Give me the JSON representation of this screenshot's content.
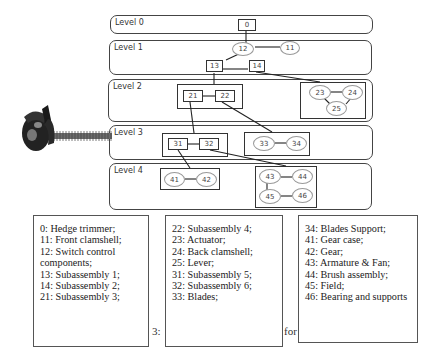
{
  "diagram": {
    "levels": [
      {
        "label": "Level 0"
      },
      {
        "label": "Level 1"
      },
      {
        "label": "Level 2"
      },
      {
        "label": "Level 3"
      },
      {
        "label": "Level 4"
      }
    ],
    "nodes": {
      "n0": "0",
      "n11": "11",
      "n12": "12",
      "n13": "13",
      "n14": "14",
      "n21": "21",
      "n22": "22",
      "n23": "23",
      "n24": "24",
      "n25": "25",
      "n31": "31",
      "n32": "32",
      "n33": "33",
      "n34": "34",
      "n41": "41",
      "n42": "42",
      "n43": "43",
      "n44": "44",
      "n45": "45",
      "n46": "46"
    },
    "image": "hedge-trimmer-photo"
  },
  "legend": {
    "col1": [
      "0: Hedge trimmer;",
      "11: Front clamshell;",
      "12: Switch control",
      "components;",
      "13: Subassembly 1;",
      "14: Subassembly 2;",
      "21: Subassembly 3;"
    ],
    "col2": [
      "22: Subassembly 4;",
      "23: Actuator;",
      "24: Back clamshell;",
      "25: Lever;",
      "31: Subassembly 5;",
      "32: Subassembly 6;",
      "33: Blades;"
    ],
    "col3": [
      "34: Blades Support;",
      "41: Gear case;",
      "42: Gear;",
      "43: Armature & Fan;",
      "44: Brush assembly;",
      "45: Field;",
      "46: Bearing and supports"
    ]
  },
  "caption": {
    "left": "3:",
    "right": "for"
  }
}
